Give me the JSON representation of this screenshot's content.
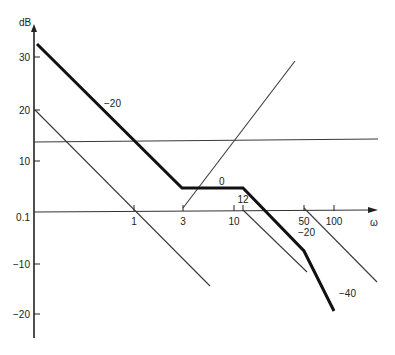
{
  "diagram": {
    "type": "bode-magnitude-asymptotic-plot",
    "y_axis": {
      "unit_label": "dB",
      "ticks": [
        {
          "label": "30",
          "y": 57
        },
        {
          "label": "20",
          "y": 110
        },
        {
          "label": "10",
          "y": 161
        },
        {
          "label": "0.1",
          "y": 212
        },
        {
          "label": "-10",
          "y": 264
        },
        {
          "label": "-20",
          "y": 314
        }
      ]
    },
    "x_axis": {
      "label": "ω",
      "ticks": [
        {
          "label": "1",
          "x": 134
        },
        {
          "label": "3",
          "x": 183
        },
        {
          "label": "10",
          "x": 234
        },
        {
          "label": "12",
          "x": 243
        },
        {
          "label": "50",
          "x": 304
        },
        {
          "label": "100",
          "x": 334
        }
      ]
    },
    "slope_labels": [
      {
        "text": "-20",
        "x": 104,
        "y": 107
      },
      {
        "text": "0",
        "x": 219,
        "y": 185
      },
      {
        "text": "-20",
        "x": 298,
        "y": 236
      },
      {
        "text": "-40",
        "x": 339,
        "y": 297
      }
    ],
    "composite_curve": {
      "name": "total asymptotic magnitude",
      "points": [
        [
          37,
          44
        ],
        [
          182,
          188
        ],
        [
          243,
          188
        ],
        [
          304,
          251
        ],
        [
          334,
          311
        ]
      ]
    },
    "component_lines": [
      {
        "name": "constant gain",
        "points": [
          [
            34,
            142
          ],
          [
            378,
            139
          ]
        ]
      },
      {
        "name": "integrator -20 dB/dec",
        "points": [
          [
            35,
            110
          ],
          [
            210,
            286
          ]
        ]
      },
      {
        "name": "zero at 3 (+20 dB/dec)",
        "points": [
          [
            183,
            208
          ],
          [
            295,
            61
          ]
        ]
      },
      {
        "name": "pole at 12 (-20 dB/dec)",
        "points": [
          [
            243,
            210
          ],
          [
            307,
            272
          ]
        ]
      },
      {
        "name": "pole at 50 (-20 dB/dec)",
        "points": [
          [
            304,
            208
          ],
          [
            377,
            282
          ]
        ]
      }
    ],
    "caption": ""
  }
}
